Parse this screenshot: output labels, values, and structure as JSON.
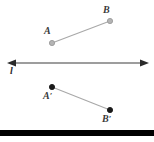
{
  "figure": {
    "width": 154,
    "height": 142,
    "background": "#ffffff"
  },
  "colors": {
    "upper_point_fill": "#b4b4b4",
    "upper_point_stroke": "#9a9a9a",
    "lower_point_fill": "#1a1a1a",
    "lower_point_stroke": "#1a1a1a",
    "segment_stroke": "#a8a8a8",
    "line_stroke": "#3c3c3c",
    "label_color": "#3a3a3a",
    "bottom_bar": "#000000"
  },
  "line_of_reflection": {
    "label": "l",
    "y": 63,
    "x_start": 8,
    "x_end": 148,
    "arrow_left": true,
    "arrow_right": true
  },
  "upper_segment": {
    "stroke": "#a8a8a8",
    "endpoints": [
      {
        "label": "A",
        "prime": "",
        "x": 52,
        "y": 43,
        "label_x": 44,
        "label_y": 26
      },
      {
        "label": "B",
        "prime": "",
        "x": 110,
        "y": 21,
        "label_x": 103,
        "label_y": 5
      }
    ]
  },
  "lower_segment": {
    "stroke": "#a8a8a8",
    "endpoints": [
      {
        "label": "A",
        "prime": "′",
        "x": 52,
        "y": 87,
        "label_x": 43,
        "label_y": 91
      },
      {
        "label": "B",
        "prime": "′",
        "x": 110,
        "y": 110,
        "label_x": 102,
        "label_y": 114
      }
    ]
  },
  "bottom_bar": {
    "y": 130,
    "height": 6,
    "color": "#000000"
  }
}
